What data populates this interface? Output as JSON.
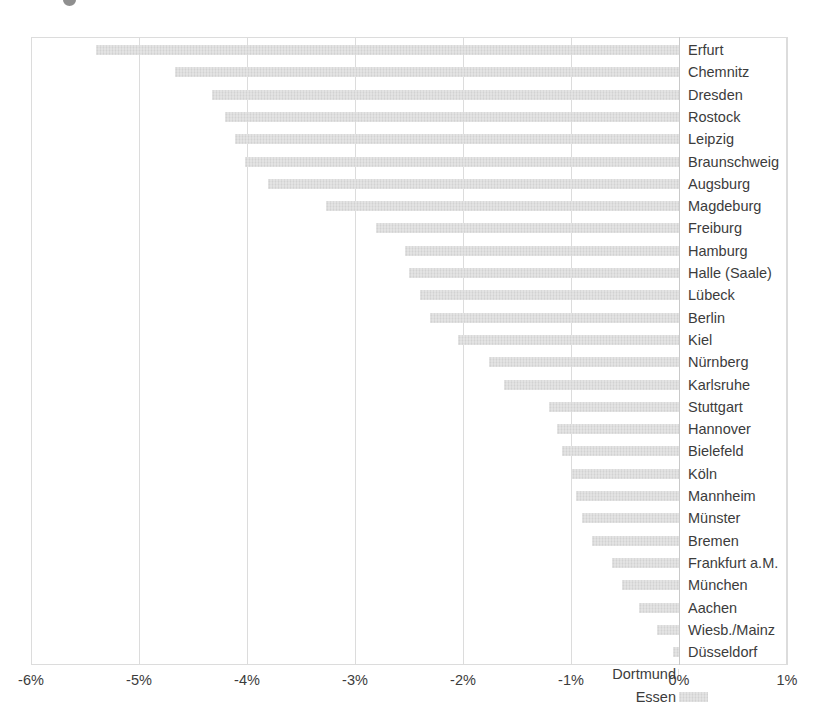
{
  "chart_data": {
    "type": "bar",
    "orientation": "horizontal",
    "title": "",
    "subtitle": "",
    "xlabel": "",
    "ylabel": "",
    "xlim": [
      -6.0,
      1.0
    ],
    "grid": true,
    "legend": false,
    "legend_position": "none",
    "bar_color": "#d2d2d2",
    "axis_color": "#dcdcdc",
    "text_color": "#3c3c3c",
    "value_unit": "%",
    "xticks": [
      {
        "value": -6,
        "label": "-6%"
      },
      {
        "value": -5,
        "label": "-5%"
      },
      {
        "value": -4,
        "label": "-4%"
      },
      {
        "value": -3,
        "label": "-3%"
      },
      {
        "value": -2,
        "label": "-2%"
      },
      {
        "value": -1,
        "label": "-1%"
      },
      {
        "value": 0,
        "label": "0%"
      },
      {
        "value": 1,
        "label": "1%"
      }
    ],
    "categories": [
      "Erfurt",
      "Chemnitz",
      "Dresden",
      "Rostock",
      "Leipzig",
      "Braunschweig",
      "Augsburg",
      "Magdeburg",
      "Freiburg",
      "Hamburg",
      "Halle (Saale)",
      "Lübeck",
      "Berlin",
      "Kiel",
      "Nürnberg",
      "Karlsruhe",
      "Stuttgart",
      "Hannover",
      "Bielefeld",
      "Köln",
      "Mannheim",
      "Münster",
      "Bremen",
      "Frankfurt a.M.",
      "München",
      "Aachen",
      "Wiesb./Mainz",
      "Düsseldorf",
      "Dortmund",
      "Essen"
    ],
    "values": [
      -5.4,
      -4.67,
      -4.32,
      -4.2,
      -4.11,
      -4.02,
      -3.81,
      -3.27,
      -2.81,
      -2.54,
      -2.5,
      -2.4,
      -2.31,
      -2.05,
      -1.76,
      -1.62,
      -1.2,
      -1.13,
      -1.08,
      -0.99,
      -0.95,
      -0.9,
      -0.81,
      -0.62,
      -0.53,
      -0.37,
      -0.2,
      -0.06,
      -0.01,
      0.27
    ],
    "label_placement": [
      "inside-right",
      "inside-right",
      "inside-right",
      "inside-right",
      "inside-right",
      "inside-right",
      "inside-right",
      "inside-right",
      "inside-right",
      "inside-right",
      "inside-right",
      "inside-right",
      "inside-right",
      "inside-right",
      "inside-right",
      "inside-right",
      "inside-right",
      "inside-right",
      "inside-right",
      "inside-right",
      "inside-right",
      "inside-right",
      "inside-right",
      "inside-right",
      "inside-right",
      "inside-right",
      "inside-right",
      "inside-right",
      "outside-left",
      "outside-left"
    ]
  }
}
